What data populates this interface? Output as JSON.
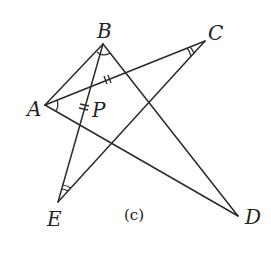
{
  "diagram": {
    "caption": "(c)",
    "points": {
      "A": {
        "label": "A",
        "x": 45,
        "y": 105
      },
      "B": {
        "label": "B",
        "x": 103,
        "y": 44
      },
      "C": {
        "label": "C",
        "x": 205,
        "y": 41
      },
      "D": {
        "label": "D",
        "x": 238,
        "y": 216
      },
      "E": {
        "label": "E",
        "x": 58,
        "y": 202
      },
      "P": {
        "label": "P",
        "x": 92,
        "y": 112
      }
    },
    "segments": [
      {
        "from": "A",
        "to": "B",
        "style": "solid"
      },
      {
        "from": "A",
        "to": "C",
        "style": "solid",
        "marks": "double-tick"
      },
      {
        "from": "A",
        "to": "D",
        "style": "solid"
      },
      {
        "from": "B",
        "to": "D",
        "style": "solid"
      },
      {
        "from": "B",
        "to": "E",
        "style": "solid",
        "marks": "double-tick"
      },
      {
        "from": "C",
        "to": "E",
        "style": "solid"
      }
    ],
    "angle_marks": [
      {
        "vertex": "A",
        "arcs": 1
      },
      {
        "vertex": "B",
        "arcs": 1
      },
      {
        "vertex": "C",
        "arcs": 2
      },
      {
        "vertex": "E",
        "arcs": 2
      }
    ]
  }
}
